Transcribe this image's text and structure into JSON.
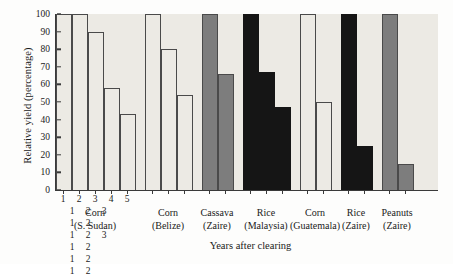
{
  "chart_data": {
    "type": "bar",
    "title": "",
    "xlabel": "Years after clearing",
    "ylabel": "Relative yield (percentage)",
    "ylim": [
      0,
      100
    ],
    "yticks": [
      0,
      10,
      20,
      30,
      40,
      50,
      60,
      70,
      80,
      90,
      100
    ],
    "grid": false,
    "legend": "none",
    "categories": [
      "1",
      "2",
      "3",
      "4",
      "5",
      "1",
      "2",
      "3",
      "1",
      "2",
      "1",
      "2",
      "3",
      "1",
      "2",
      "1",
      "2",
      "1",
      "2"
    ],
    "values": [
      100,
      100,
      90,
      58,
      43,
      100,
      80,
      54,
      100,
      66,
      100,
      67,
      47,
      100,
      50,
      100,
      25,
      100,
      15
    ],
    "groups": [
      {
        "crop": "Corn",
        "place": "(S. Sudan)",
        "shade": "light",
        "years": [
          "1",
          "2",
          "3",
          "4",
          "5"
        ],
        "values": [
          100,
          100,
          90,
          58,
          43
        ]
      },
      {
        "crop": "Corn",
        "place": "(Belize)",
        "shade": "light",
        "years": [
          "1",
          "2",
          "3"
        ],
        "values": [
          100,
          80,
          54
        ]
      },
      {
        "crop": "Cassava",
        "place": "(Zaire)",
        "shade": "mid",
        "years": [
          "1",
          "2"
        ],
        "values": [
          100,
          66
        ]
      },
      {
        "crop": "Rice",
        "place": "(Malaysia)",
        "shade": "dark",
        "years": [
          "1",
          "2",
          "3"
        ],
        "values": [
          100,
          67,
          47
        ]
      },
      {
        "crop": "Corn",
        "place": "(Guatemala)",
        "shade": "light",
        "years": [
          "1",
          "2"
        ],
        "values": [
          100,
          50
        ]
      },
      {
        "crop": "Rice",
        "place": "(Zaire)",
        "shade": "dark",
        "years": [
          "1",
          "2"
        ],
        "values": [
          100,
          25
        ]
      },
      {
        "crop": "Peanuts",
        "place": "(Zaire)",
        "shade": "mid",
        "years": [
          "1",
          "2"
        ],
        "values": [
          100,
          15
        ]
      }
    ],
    "colors": {
      "light": "#eceae4",
      "mid": "#7d7d7d",
      "dark": "#151515",
      "axis": "#3a3a3a",
      "plot_background": "#eceae4",
      "page_background": "#fdfdfc"
    }
  }
}
